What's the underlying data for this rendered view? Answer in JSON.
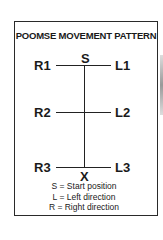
{
  "diagram": {
    "title": "POOMSE MOVEMENT PATTERN",
    "start_label": "S",
    "end_label": "X",
    "rows": [
      {
        "left": "R1",
        "right": "L1"
      },
      {
        "left": "R2",
        "right": "L2"
      },
      {
        "left": "R3",
        "right": "L3"
      }
    ],
    "legend": [
      "S = Start position",
      "L = Left direction",
      "R = Right direction"
    ]
  }
}
